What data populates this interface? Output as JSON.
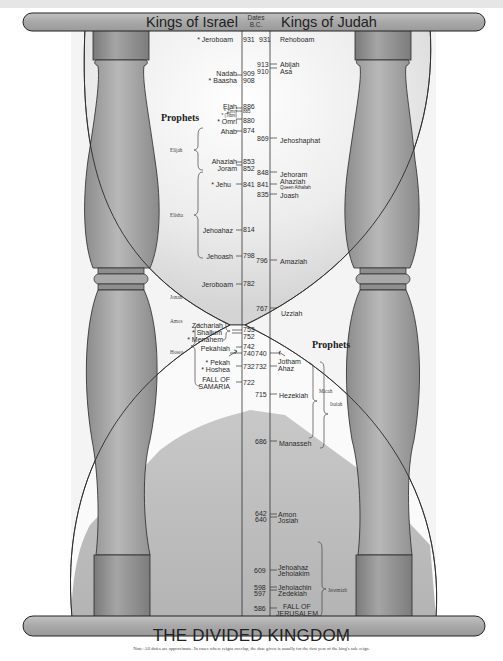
{
  "header": {
    "left_title": "Kings of Israel",
    "dates_label_line1": "Dates",
    "dates_label_line2": "B.C.",
    "right_title": "Kings of Judah"
  },
  "footer": {
    "title": "THE DIVIDED KINGDOM",
    "note": "Note: All dates are approximate. In cases where reigns overlap, the date given is usually for the first year of the king's sole reign."
  },
  "israel_kings": [
    {
      "name": "* Jeroboam",
      "date": "931"
    },
    {
      "name": "Nadab",
      "date": "909"
    },
    {
      "name": "* Baasha",
      "date": "908"
    },
    {
      "name": "Elah",
      "date": "886"
    },
    {
      "name": "* Zimri",
      "date": "885"
    },
    {
      "name": "* (Tibni)",
      "date": "885"
    },
    {
      "name": "* Omri",
      "date": "880"
    },
    {
      "name": "Ahab",
      "date": "874"
    },
    {
      "name": "Ahaziah",
      "date": "853"
    },
    {
      "name": "Joram",
      "date": "852"
    },
    {
      "name": "* Jehu",
      "date": "841"
    },
    {
      "name": "Jehoahaz",
      "date": "814"
    },
    {
      "name": "Jehoash",
      "date": "798"
    },
    {
      "name": "Jeroboam",
      "date": "782"
    },
    {
      "name": "Zachariah",
      "date": "753"
    },
    {
      "name": "* Shallum",
      "date": "752"
    },
    {
      "name": "* Menahem",
      "date": "752"
    },
    {
      "name": "Pekahiah",
      "date": "742"
    },
    {
      "name": "* Pekah",
      "date": "740"
    },
    {
      "name": "* Hoshea",
      "date": "732"
    },
    {
      "name": "FALL OF SAMARIA",
      "date": "722"
    }
  ],
  "judah_kings": [
    {
      "name": "Rehoboam",
      "date": "931"
    },
    {
      "name": "Abijah",
      "date": "913"
    },
    {
      "name": "Asa",
      "date": "910"
    },
    {
      "name": "Jehoshaphat",
      "date": "869"
    },
    {
      "name": "Jehoram",
      "date": "848"
    },
    {
      "name": "Ahaziah",
      "date": "841"
    },
    {
      "name": "Queen Athaliah",
      "date": "841"
    },
    {
      "name": "Joash",
      "date": "835"
    },
    {
      "name": "Amaziah",
      "date": "796"
    },
    {
      "name": "Uzziah",
      "date": "767"
    },
    {
      "name": "Jotham",
      "date": "740"
    },
    {
      "name": "Ahaz",
      "date": "732"
    },
    {
      "name": "Hezekiah",
      "date": "715"
    },
    {
      "name": "Manasseh",
      "date": "686"
    },
    {
      "name": "Amon",
      "date": "642"
    },
    {
      "name": "Josiah",
      "date": "640"
    },
    {
      "name": "Jehoahaz",
      "date": "609"
    },
    {
      "name": "Jehoiakim",
      "date": "609"
    },
    {
      "name": "Jehoiachin",
      "date": "598"
    },
    {
      "name": "Zedekiah",
      "date": "597"
    },
    {
      "name": "FALL OF JERUSALEM",
      "date": "586"
    }
  ],
  "israel_prophets": {
    "heading": "Prophets",
    "names": [
      "Elijah",
      "Elisha",
      "Jonah",
      "Amos",
      "Hosea"
    ]
  },
  "judah_prophets": {
    "heading": "Prophets",
    "names": [
      "Micah",
      "Isaiah",
      "Jeremiah"
    ]
  },
  "labels": {
    "i": {
      "jeroboam1": "* Jeroboam",
      "d931a": "931",
      "nadab": "Nadab",
      "d909": "909",
      "baasha": "* Baasha",
      "d908": "908",
      "elah": "Elah",
      "d886": "886",
      "zimri": "* Zimri",
      "d885": "885",
      "tibni": "* (Tibni)",
      "d885b": "885",
      "omri": "* Omri",
      "d880": "880",
      "ahab": "Ahab",
      "d874": "874",
      "ahaziah": "Ahaziah",
      "d853": "853",
      "joram": "Joram",
      "d852": "852",
      "jehu": "* Jehu",
      "d841a": "841",
      "jehoahaz": "Jehoahaz",
      "d814": "814",
      "jehoash": "Jehoash",
      "d798": "798",
      "jeroboam2": "Jeroboam",
      "d782": "782",
      "zachariah": "Zachariah",
      "shallum": "* Shallum",
      "menahem": "* Menahem",
      "d753": "753",
      "d752": "752",
      "pekahiah": "Pekahiah",
      "d742": "742",
      "d740a": "740",
      "pekah": "* Pekah",
      "hoshea": "* Hoshea",
      "d732a": "732",
      "fall1": "FALL OF",
      "fall2": "SAMARIA",
      "d722": "722"
    },
    "j": {
      "d931b": "931",
      "rehoboam": "Rehoboam",
      "d913": "913",
      "abijah": "Abijah",
      "d910": "910",
      "asa": "Asa",
      "d869": "869",
      "jehoshaphat": "Jehoshaphat",
      "d848": "848",
      "jehoram": "Jehoram",
      "d841b": "841",
      "ahaziah": "Ahaziah",
      "athaliah": "Queen Athaliah",
      "d835": "835",
      "joash": "Joash",
      "d796": "796",
      "amaziah": "Amaziah",
      "d767": "767",
      "uzziah": "Uzziah",
      "d740b": "740",
      "jotham": "Jotham",
      "d732b": "732",
      "ahaz": "Ahaz",
      "d715": "715",
      "hezekiah": "Hezekiah",
      "d686": "686",
      "manasseh": "Manasseh",
      "d642": "642",
      "amon": "Amon",
      "d640": "640",
      "josiah": "Josiah",
      "d609": "609",
      "jehoahaz": "Jehoahaz",
      "jehoiakim": "Jehoiakim",
      "d598": "598",
      "jehoiachin": "Jehoiachin",
      "d597": "597",
      "zedekiah": "Zedekiah",
      "d586": "586",
      "fall1": "FALL OF",
      "fall2": "JERUSALEM"
    }
  },
  "colors": {
    "cap_fill": "#a9a9a9",
    "pillar_fill": "#9c9c9c",
    "sand_fill": "#bdbdbd",
    "outline": "#2a2a2a",
    "background": "#ffffff"
  }
}
